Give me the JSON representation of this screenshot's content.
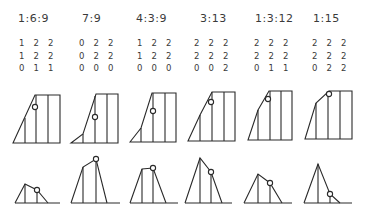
{
  "panels": [
    {
      "ratio": "1:6:9",
      "matrix": [
        "1 2 2",
        "1 2 2",
        "0 1 1"
      ]
    },
    {
      "ratio": "7:9",
      "matrix": [
        "0 2 2",
        "0 2 2",
        "0 0 0"
      ]
    },
    {
      "ratio": "4:3:9",
      "matrix": [
        "1 2 2",
        "1 2 2",
        "0 0 0"
      ]
    },
    {
      "ratio": "3:13",
      "matrix": [
        "2 2 2",
        "2 2 2",
        "0 0 2"
      ]
    },
    {
      "ratio": "1:3:12",
      "matrix": [
        "2 2 2",
        "2 2 2",
        "0 1 1"
      ]
    },
    {
      "ratio": "1:15",
      "matrix": [
        "2 2 2",
        "2 2 2",
        "0 2 2"
      ]
    }
  ],
  "stroke_color": "#2a2a2a",
  "background_color": "#ffffff"
}
